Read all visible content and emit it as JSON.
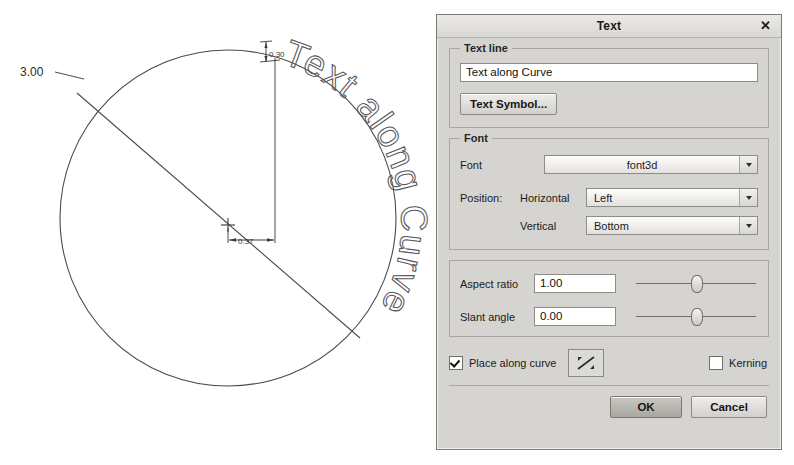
{
  "drawing": {
    "diameter_label": "3.00",
    "height_label": "0.30",
    "offset_label": "0.37",
    "curve_text": "Text along Curve",
    "line_color": "#3a3a3a"
  },
  "dialog": {
    "title": "Text",
    "close_label": "✕",
    "text_line": {
      "group_label": "Text line",
      "value": "Text along Curve",
      "placeholder": "",
      "symbol_button": "Text Symbol..."
    },
    "font": {
      "group_label": "Font",
      "font_label": "Font",
      "font_value": "font3d",
      "position_label": "Position:",
      "horizontal_label": "Horizontal",
      "horizontal_value": "Left",
      "vertical_label": "Vertical",
      "vertical_value": "Bottom"
    },
    "params": {
      "aspect_label": "Aspect ratio",
      "aspect_value": "1.00",
      "slant_label": "Slant angle",
      "slant_value": "0.00"
    },
    "options": {
      "place_along_curve_label": "Place along curve",
      "place_along_curve_checked": true,
      "kerning_label": "Kerning",
      "kerning_checked": false
    },
    "footer": {
      "ok_label": "OK",
      "cancel_label": "Cancel"
    }
  }
}
